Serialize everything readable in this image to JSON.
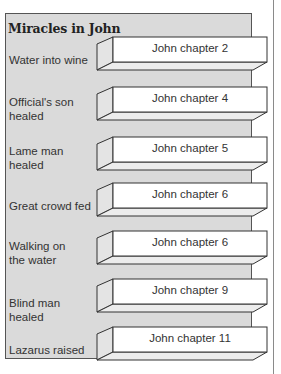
{
  "title": "Miracles in John",
  "rows": [
    {
      "miracle": "Water into wine",
      "reference": "John chapter 2",
      "top": 37,
      "label_top": 53
    },
    {
      "miracle": "Official's son healed",
      "reference": "John chapter 4",
      "top": 87,
      "label_top": 95
    },
    {
      "miracle": "Lame man healed",
      "reference": "John chapter 5",
      "top": 137,
      "label_top": 144
    },
    {
      "miracle": "Great crowd fed",
      "reference": "John chapter 6",
      "top": 183,
      "label_top": 199
    },
    {
      "miracle": "Walking on the water",
      "reference": "John chapter 6",
      "top": 231,
      "label_top": 239
    },
    {
      "miracle": "Blind man healed",
      "reference": "John chapter 9",
      "top": 279,
      "label_top": 296
    },
    {
      "miracle": "Lazarus raised",
      "reference": "John chapter 11",
      "top": 327,
      "label_top": 343
    }
  ],
  "colors": {
    "panel": "#dadada",
    "box_front": "#ffffff",
    "box_side": "#e4e4e4",
    "box_bottom": "#ececec",
    "stroke": "#333333"
  }
}
